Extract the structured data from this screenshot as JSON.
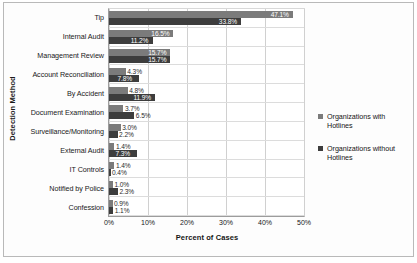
{
  "chart_data": {
    "type": "bar",
    "orientation": "horizontal",
    "title": "",
    "xlabel": "Percent of Cases",
    "ylabel": "Detection Method",
    "categories": [
      "Tip",
      "Internal Audit",
      "Management Review",
      "Account Reconciliation",
      "By Accident",
      "Document Examination",
      "Surveillance/Monitoring",
      "External Audit",
      "IT Controls",
      "Notified by Police",
      "Confession"
    ],
    "series": [
      {
        "name": "Organizations with Hotlines",
        "color": "#7b7b7b",
        "values": [
          47.1,
          16.5,
          15.7,
          4.3,
          4.8,
          3.7,
          3.0,
          1.4,
          1.4,
          1.0,
          0.9
        ],
        "labels": [
          "47.1%",
          "16.5%",
          "15.7%",
          "4.3%",
          "4.8%",
          "3.7%",
          "3.0%",
          "1.4%",
          "1.4%",
          "1.0%",
          "0.9%"
        ]
      },
      {
        "name": "Organizations without Hotlines",
        "color": "#3d3d3d",
        "values": [
          33.8,
          11.2,
          15.7,
          7.8,
          11.9,
          6.5,
          2.2,
          7.3,
          0.4,
          2.3,
          1.1
        ],
        "labels": [
          "33.8%",
          "11.2%",
          "15.7%",
          "7.8%",
          "11.9%",
          "6.5%",
          "2.2%",
          "7.3%",
          "0.4%",
          "2.3%",
          "1.1%"
        ]
      }
    ],
    "xlim": [
      0,
      50
    ],
    "xticks": [
      0,
      10,
      20,
      30,
      40,
      50
    ],
    "xticklabels": [
      "0%",
      "10%",
      "20%",
      "30%",
      "40%",
      "50%"
    ],
    "grid": true,
    "legend_position": "right"
  },
  "legend": {
    "items": [
      {
        "label": "Organizations with Hotlines"
      },
      {
        "label": "Organizations without Hotlines"
      }
    ]
  }
}
